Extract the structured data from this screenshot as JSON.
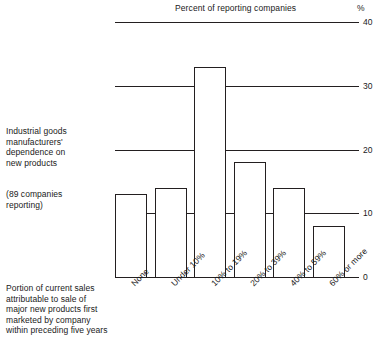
{
  "chart_data": {
    "type": "bar",
    "title": "Percent of reporting companies",
    "xlabel": "Portion of current sales attributable to sale of major new products first marketed by company within preceding five years",
    "ylabel": "%",
    "ylim": [
      0,
      40
    ],
    "yticks": [
      0,
      10,
      20,
      30,
      40
    ],
    "ytick_labels": [
      "0",
      "10",
      "20",
      "30",
      "40"
    ],
    "grid": true,
    "legend": "none",
    "categories": [
      "None",
      "Under 10%",
      "10% to 19%",
      "20% to 39%",
      "40% to 59%",
      "60% or more"
    ],
    "values": [
      13,
      14,
      33,
      18,
      14,
      8
    ],
    "annotations": [
      "Industrial goods manufacturers' dependence on new products",
      "(89 companies reporting)"
    ]
  },
  "axis": {
    "unit_symbol": "%",
    "ticks": [
      {
        "label": "40",
        "value": 40
      },
      {
        "label": "30",
        "value": 30
      },
      {
        "label": "20",
        "value": 20
      },
      {
        "label": "10",
        "value": 10
      },
      {
        "label": "0",
        "value": 0
      }
    ]
  },
  "captions": {
    "main": [
      "Industrial goods",
      "manufacturers'",
      "dependence on",
      "new products"
    ],
    "sub": [
      "(89 companies",
      "reporting)"
    ],
    "bottom": [
      "Portion of current sales",
      "attributable to sale of",
      "major new products first",
      "marketed by company",
      "within preceding five years"
    ]
  }
}
